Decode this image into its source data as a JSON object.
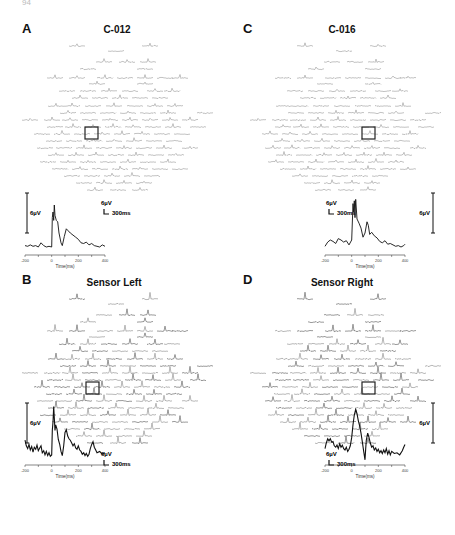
{
  "page_number": "94",
  "panels": [
    {
      "letter": "A",
      "title": "C-012",
      "inset_side": "left",
      "scale_bar": {
        "voltage": "6µV",
        "time": "300ms"
      },
      "trace_scale_label": "6µV",
      "x_ticks": [
        "-200",
        "0",
        "200",
        "400"
      ],
      "x_label": "Time(ms)",
      "box": {
        "x": 85,
        "y": 127
      },
      "trace": [
        [
          -200,
          0.2
        ],
        [
          -180,
          0.1
        ],
        [
          -160,
          0.3
        ],
        [
          -140,
          0.1
        ],
        [
          -120,
          0.2
        ],
        [
          -100,
          0.0
        ],
        [
          -80,
          0.6
        ],
        [
          -60,
          0.2
        ],
        [
          -40,
          0.0
        ],
        [
          -20,
          0.1
        ],
        [
          0,
          0.0
        ],
        [
          5,
          4.2
        ],
        [
          10,
          5.0
        ],
        [
          15,
          3.8
        ],
        [
          20,
          6.0
        ],
        [
          25,
          4.5
        ],
        [
          35,
          3.8
        ],
        [
          45,
          3.6
        ],
        [
          55,
          2.0
        ],
        [
          70,
          0.6
        ],
        [
          80,
          0.2
        ],
        [
          95,
          1.5
        ],
        [
          110,
          2.6
        ],
        [
          125,
          2.3
        ],
        [
          140,
          2.0
        ],
        [
          160,
          1.7
        ],
        [
          180,
          1.4
        ],
        [
          200,
          1.1
        ],
        [
          220,
          0.6
        ],
        [
          240,
          0.5
        ],
        [
          260,
          0.7
        ],
        [
          280,
          0.3
        ],
        [
          300,
          0.5
        ],
        [
          320,
          0.2
        ],
        [
          340,
          0.1
        ],
        [
          360,
          0.0
        ],
        [
          380,
          0.3
        ],
        [
          400,
          0.1
        ]
      ]
    },
    {
      "letter": "C",
      "title": "C-016",
      "inset_side": "right",
      "scale_bar": {
        "voltage": "6µV",
        "time": "300ms"
      },
      "trace_scale_label": "6µV",
      "x_ticks": [
        "-200",
        "0",
        "200",
        "400"
      ],
      "x_label": "Time(ms)",
      "box": {
        "x": 362,
        "y": 127
      },
      "trace": [
        [
          -200,
          0.1
        ],
        [
          -180,
          0.7
        ],
        [
          -160,
          1.0
        ],
        [
          -140,
          0.8
        ],
        [
          -120,
          0.5
        ],
        [
          -100,
          1.2
        ],
        [
          -80,
          1.0
        ],
        [
          -60,
          0.7
        ],
        [
          -40,
          0.9
        ],
        [
          -20,
          0.3
        ],
        [
          0,
          1.0
        ],
        [
          10,
          6.2
        ],
        [
          15,
          5.0
        ],
        [
          20,
          6.6
        ],
        [
          25,
          4.2
        ],
        [
          30,
          6.8
        ],
        [
          40,
          4.0
        ],
        [
          55,
          3.4
        ],
        [
          70,
          2.7
        ],
        [
          85,
          1.4
        ],
        [
          100,
          2.0
        ],
        [
          115,
          3.6
        ],
        [
          125,
          3.1
        ],
        [
          135,
          1.8
        ],
        [
          150,
          2.1
        ],
        [
          170,
          1.6
        ],
        [
          190,
          1.3
        ],
        [
          210,
          0.8
        ],
        [
          230,
          0.6
        ],
        [
          250,
          0.9
        ],
        [
          270,
          0.4
        ],
        [
          290,
          0.5
        ],
        [
          310,
          0.3
        ],
        [
          330,
          0.1
        ],
        [
          350,
          0.2
        ],
        [
          370,
          0.0
        ],
        [
          390,
          0.2
        ],
        [
          400,
          0.4
        ]
      ]
    },
    {
      "letter": "B",
      "title": "Sensor Left",
      "inset_side": "left",
      "scale_bar": {
        "voltage": "6µV",
        "time": "300ms"
      },
      "trace_scale_label": "6µV",
      "x_ticks": [
        "-200",
        "0",
        "200",
        "400"
      ],
      "x_label": "Time(ms)",
      "box": {
        "x": 86,
        "y": 382
      },
      "trace": [
        [
          -200,
          2.4
        ],
        [
          -190,
          1.6
        ],
        [
          -180,
          1.2
        ],
        [
          -170,
          1.8
        ],
        [
          -160,
          1.0
        ],
        [
          -150,
          1.5
        ],
        [
          -140,
          0.7
        ],
        [
          -130,
          1.4
        ],
        [
          -120,
          1.1
        ],
        [
          -110,
          1.7
        ],
        [
          -100,
          0.9
        ],
        [
          -90,
          1.3
        ],
        [
          -80,
          1.6
        ],
        [
          -70,
          0.6
        ],
        [
          -60,
          0.9
        ],
        [
          -50,
          0.3
        ],
        [
          -40,
          0.8
        ],
        [
          -30,
          0.2
        ],
        [
          -20,
          0.6
        ],
        [
          -10,
          0.1
        ],
        [
          0,
          0.3
        ],
        [
          5,
          3.8
        ],
        [
          10,
          5.0
        ],
        [
          15,
          7.2
        ],
        [
          20,
          5.6
        ],
        [
          25,
          3.8
        ],
        [
          30,
          4.6
        ],
        [
          40,
          4.0
        ],
        [
          50,
          2.5
        ],
        [
          60,
          1.8
        ],
        [
          70,
          0.8
        ],
        [
          80,
          0.2
        ],
        [
          90,
          1.6
        ],
        [
          100,
          3.5
        ],
        [
          110,
          3.9
        ],
        [
          120,
          3.0
        ],
        [
          130,
          2.6
        ],
        [
          140,
          2.4
        ],
        [
          150,
          2.0
        ],
        [
          160,
          1.6
        ],
        [
          170,
          1.9
        ],
        [
          180,
          1.3
        ],
        [
          190,
          1.1
        ],
        [
          200,
          1.6
        ],
        [
          210,
          1.0
        ],
        [
          220,
          0.8
        ],
        [
          230,
          0.4
        ],
        [
          240,
          0.6
        ],
        [
          250,
          0.2
        ],
        [
          260,
          0.5
        ],
        [
          270,
          0.1
        ],
        [
          280,
          0.4
        ],
        [
          290,
          1.2
        ],
        [
          300,
          1.8
        ],
        [
          310,
          2.2
        ],
        [
          320,
          1.4
        ],
        [
          330,
          1.0
        ],
        [
          340,
          0.6
        ],
        [
          360,
          0.8
        ],
        [
          380,
          0.4
        ],
        [
          400,
          0.6
        ]
      ]
    },
    {
      "letter": "D",
      "title": "Sensor Right",
      "inset_side": "right",
      "scale_bar": {
        "voltage": "6µV",
        "time": "300ms"
      },
      "trace_scale_label": "6µV",
      "x_ticks": [
        "-200",
        "0",
        "200",
        "400"
      ],
      "x_label": "Time(ms)",
      "box": {
        "x": 362,
        "y": 382
      },
      "trace": [
        [
          -200,
          1.2
        ],
        [
          -190,
          2.0
        ],
        [
          -180,
          2.6
        ],
        [
          -170,
          2.3
        ],
        [
          -160,
          2.6
        ],
        [
          -150,
          2.1
        ],
        [
          -140,
          2.2
        ],
        [
          -130,
          1.6
        ],
        [
          -120,
          1.4
        ],
        [
          -110,
          1.7
        ],
        [
          -100,
          1.2
        ],
        [
          -90,
          1.9
        ],
        [
          -80,
          1.4
        ],
        [
          -70,
          1.7
        ],
        [
          -60,
          1.2
        ],
        [
          -50,
          1.0
        ],
        [
          -40,
          1.4
        ],
        [
          -30,
          0.8
        ],
        [
          -20,
          1.1
        ],
        [
          -10,
          1.6
        ],
        [
          0,
          2.8
        ],
        [
          10,
          4.6
        ],
        [
          20,
          6.0
        ],
        [
          30,
          6.8
        ],
        [
          40,
          6.2
        ],
        [
          50,
          5.2
        ],
        [
          60,
          4.4
        ],
        [
          70,
          3.4
        ],
        [
          80,
          2.2
        ],
        [
          90,
          0.8
        ],
        [
          100,
          -0.4
        ],
        [
          105,
          1.2
        ],
        [
          110,
          2.4
        ],
        [
          120,
          3.4
        ],
        [
          130,
          2.8
        ],
        [
          140,
          2.0
        ],
        [
          150,
          1.4
        ],
        [
          160,
          1.6
        ],
        [
          170,
          1.0
        ],
        [
          180,
          1.3
        ],
        [
          190,
          0.8
        ],
        [
          200,
          1.1
        ],
        [
          210,
          0.6
        ],
        [
          220,
          0.9
        ],
        [
          230,
          0.5
        ],
        [
          240,
          1.0
        ],
        [
          250,
          0.6
        ],
        [
          260,
          1.2
        ],
        [
          270,
          0.4
        ],
        [
          280,
          0.9
        ],
        [
          290,
          0.3
        ],
        [
          300,
          0.8
        ],
        [
          320,
          0.5
        ],
        [
          340,
          0.6
        ],
        [
          360,
          0.3
        ],
        [
          380,
          0.9
        ],
        [
          390,
          1.4
        ],
        [
          400,
          1.8
        ]
      ]
    }
  ]
}
